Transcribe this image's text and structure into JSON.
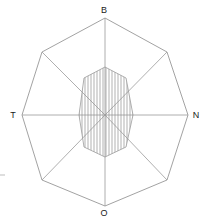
{
  "figure": {
    "title": "",
    "type": "octagon-radial-diagram",
    "labels": {
      "top": "B",
      "right": "N",
      "bottom": "O",
      "left": "T"
    },
    "colors": {
      "outline": "#8a8a8a",
      "spoke": "#9a9a9a",
      "hatch": "#8f8f8f",
      "label": "#1a1a1a",
      "background": "#ffffff"
    }
  },
  "chart_data": {
    "type": "line",
    "title": "",
    "xlabel": "",
    "ylabel": "",
    "grid": false,
    "legend": "none",
    "center": [
      105,
      115
    ],
    "directions": [
      "B",
      "N",
      "O",
      "T"
    ],
    "direction_angles_deg": [
      90,
      0,
      270,
      180
    ],
    "outer_polygon": {
      "name": "outer octagon",
      "sides": 8,
      "vertices": [
        [
          105,
          18
        ],
        [
          167,
          52
        ],
        [
          188,
          115
        ],
        [
          167,
          180
        ],
        [
          105,
          206
        ],
        [
          42,
          180
        ],
        [
          22,
          115
        ],
        [
          42,
          52
        ]
      ]
    },
    "inner_polygon": {
      "name": "inner hatched octagon",
      "sides": 8,
      "hatch": "vertical",
      "hatch_spacing_px": 3,
      "vertices": [
        [
          105,
          67
        ],
        [
          126,
          78
        ],
        [
          133,
          115
        ],
        [
          126,
          147
        ],
        [
          105,
          157
        ],
        [
          84,
          147
        ],
        [
          79,
          115
        ],
        [
          84,
          78
        ]
      ]
    },
    "spokes": [
      {
        "from": [
          105,
          115
        ],
        "to": [
          105,
          18
        ],
        "label": "B"
      },
      {
        "from": [
          105,
          115
        ],
        "to": [
          167,
          52
        ],
        "label": ""
      },
      {
        "from": [
          105,
          115
        ],
        "to": [
          188,
          115
        ],
        "label": "N"
      },
      {
        "from": [
          105,
          115
        ],
        "to": [
          167,
          180
        ],
        "label": ""
      },
      {
        "from": [
          105,
          115
        ],
        "to": [
          105,
          206
        ],
        "label": "O"
      },
      {
        "from": [
          105,
          115
        ],
        "to": [
          42,
          180
        ],
        "label": ""
      },
      {
        "from": [
          105,
          115
        ],
        "to": [
          22,
          115
        ],
        "label": "T"
      },
      {
        "from": [
          105,
          115
        ],
        "to": [
          42,
          52
        ],
        "label": ""
      }
    ],
    "label_positions": {
      "B": [
        104,
        13
      ],
      "N": [
        194,
        118
      ],
      "O": [
        104,
        215
      ],
      "T": [
        12,
        118
      ]
    }
  }
}
